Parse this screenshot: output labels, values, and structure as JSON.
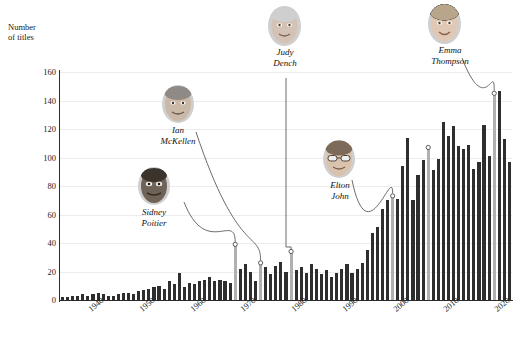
{
  "chart_data": {
    "type": "bar",
    "title": "",
    "subtitle": "",
    "xlabel": "",
    "ylabel": "Number\nof titles",
    "ylim": [
      0,
      160
    ],
    "yticks": [
      0,
      20,
      40,
      60,
      80,
      100,
      120,
      140,
      160
    ],
    "xticks": [
      "1940",
      "1950",
      "1960",
      "1970",
      "1980",
      "1990",
      "2000",
      "2010",
      "2020"
    ],
    "grid": true,
    "legend": "none",
    "bar_color": "#2e2e2e",
    "highlight_color": "#b0b0b0",
    "x_start_year": 1935,
    "x_end_year": 2023,
    "categories": [
      1935,
      1936,
      1937,
      1938,
      1939,
      1940,
      1941,
      1942,
      1943,
      1944,
      1945,
      1946,
      1947,
      1948,
      1949,
      1950,
      1951,
      1952,
      1953,
      1954,
      1955,
      1956,
      1957,
      1958,
      1959,
      1960,
      1961,
      1962,
      1963,
      1964,
      1965,
      1966,
      1967,
      1968,
      1969,
      1970,
      1971,
      1972,
      1973,
      1974,
      1975,
      1976,
      1977,
      1978,
      1979,
      1980,
      1981,
      1982,
      1983,
      1984,
      1985,
      1986,
      1987,
      1988,
      1989,
      1990,
      1991,
      1992,
      1993,
      1994,
      1995,
      1996,
      1997,
      1998,
      1999,
      2000,
      2001,
      2002,
      2003,
      2004,
      2005,
      2006,
      2007,
      2008,
      2009,
      2010,
      2011,
      2012,
      2013,
      2014,
      2015,
      2016,
      2017,
      2018,
      2019,
      2020,
      2021,
      2022,
      2023
    ],
    "values": [
      2,
      2,
      3,
      3,
      4,
      3,
      4,
      5,
      4,
      3,
      3,
      4,
      5,
      5,
      4,
      6,
      7,
      8,
      9,
      10,
      8,
      13,
      11,
      19,
      9,
      12,
      11,
      13,
      14,
      16,
      13,
      14,
      13,
      12,
      38,
      22,
      25,
      20,
      13,
      25,
      23,
      18,
      24,
      27,
      20,
      33,
      21,
      23,
      19,
      25,
      22,
      18,
      21,
      16,
      19,
      22,
      25,
      19,
      22,
      26,
      35,
      47,
      51,
      64,
      70,
      72,
      71,
      94,
      114,
      70,
      88,
      98,
      106,
      91,
      99,
      125,
      115,
      122,
      108,
      106,
      109,
      92,
      97,
      123,
      101,
      144,
      147,
      113,
      97
    ],
    "highlight_indices": [
      34,
      39,
      45,
      65,
      72,
      85
    ],
    "highlight_years": [
      1969,
      1974,
      1980,
      2000,
      2007,
      2020
    ]
  },
  "annotations": [
    {
      "name": "sidney-poitier",
      "label": "Sidney\nPoitier",
      "target_year": 1969,
      "target_value": 38
    },
    {
      "name": "ian-mckellen",
      "label": "Ian\nMcKellen",
      "target_year": 1974,
      "target_value": 25
    },
    {
      "name": "judy-dench",
      "label": "Judy\nDench",
      "target_year": 1980,
      "target_value": 33
    },
    {
      "name": "elton-john",
      "label": "Elton\nJohn",
      "target_year": 2000,
      "target_value": 72
    },
    {
      "name": "emma-thompson",
      "label": "Emma\nThompson",
      "target_year": 2020,
      "target_value": 144
    }
  ],
  "footnote": {
    "text": ""
  }
}
